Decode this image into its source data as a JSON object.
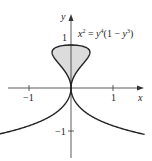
{
  "chart_data": {
    "type": "line",
    "title": "",
    "equation": "x² = y⁴(1 − y³)",
    "equation_parts": {
      "lhs_var": "x",
      "lhs_exp": "2",
      "eq": " = ",
      "rhs_var": "y",
      "rhs_exp": "4",
      "rhs_mid": "(1 − ",
      "rhs_var2": "y",
      "rhs_exp2": "3",
      "rhs_end": ")"
    },
    "xlabel": "x",
    "ylabel": "y",
    "xlim": [
      -1.7,
      1.5
    ],
    "ylim": [
      -1.65,
      2.1
    ],
    "x_ticks": [
      {
        "value": -1,
        "label": "−1"
      },
      {
        "value": 1,
        "label": "1"
      }
    ],
    "y_ticks": [
      {
        "value": 1,
        "label": "1"
      },
      {
        "value": -1,
        "label": "−1"
      }
    ],
    "grid": false,
    "curve": {
      "name": "x^2 = y^4(1 - y^3)",
      "parametric": "x = ±y²·sqrt(1 − y³)",
      "y_range": [
        -1.08,
        1.0
      ],
      "loop_fill_region": "0 ≤ y ≤ 1",
      "loop_fill_color": "#dcdcdc",
      "line_color": "#222222"
    }
  }
}
